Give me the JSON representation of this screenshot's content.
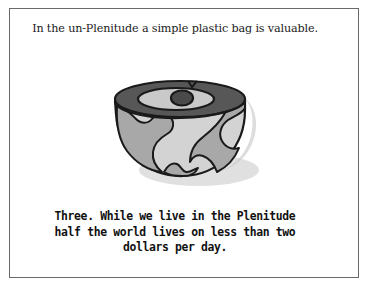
{
  "panel": {
    "background_color": "#ffffff",
    "frame_color": "#6a6a6a"
  },
  "caption_top": {
    "text": "In the un-Plenitude a simple plastic bag is valuable."
  },
  "caption_bottom": {
    "line1": "Three. While we live in the Plenitude",
    "line2": "half the world lives on less than two",
    "line3": "dollars per day."
  },
  "illustration": {
    "name": "sliced-globe",
    "description": "A globe with its top sliced flat, showing land masses in gray on a lighter sphere, with a dark polar cap ring and a small dark circle at the pole.",
    "colors": {
      "outline": "#1a1a1a",
      "ocean_light": "#d3d3d3",
      "land_gray": "#a8a8a8",
      "cap_dark": "#575757",
      "cap_inner": "#c9c9c9",
      "pole_dot": "#4a4a4a",
      "drop_shadow": "#bfbfbf"
    }
  }
}
